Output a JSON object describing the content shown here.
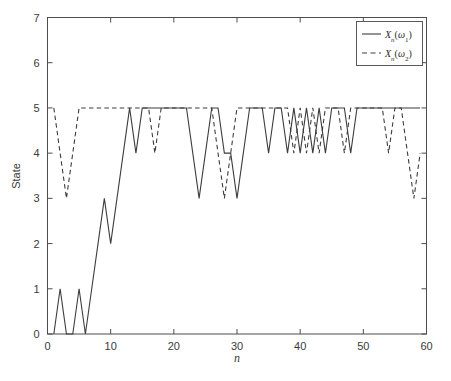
{
  "chart_data": {
    "type": "line",
    "title": "",
    "xlabel": "n",
    "ylabel": "State",
    "xlim": [
      0,
      60
    ],
    "ylim": [
      0,
      7
    ],
    "xticks": [
      0,
      10,
      20,
      30,
      40,
      50,
      60
    ],
    "yticks": [
      0,
      1,
      2,
      3,
      4,
      5,
      6,
      7
    ],
    "xtick_labels": [
      "0",
      "10",
      "20",
      "30",
      "40",
      "50",
      "60"
    ],
    "ytick_labels": [
      "0",
      "1",
      "2",
      "3",
      "4",
      "5",
      "6",
      "7"
    ],
    "grid": false,
    "legend_position": "top-right",
    "line_color": "#3d3d3d",
    "axis_color": "#4d4d4d",
    "background": "#ffffff",
    "series": [
      {
        "name": "X_n(omega_1)",
        "label": "Xn(ω1)",
        "label_base": "X",
        "label_sub": "n",
        "label_arg_open": "(",
        "label_omega": "ω",
        "label_omega_sub": "1",
        "label_arg_close": ")",
        "style": "solid",
        "x": [
          1,
          2,
          3,
          4,
          5,
          6,
          7,
          8,
          9,
          10,
          11,
          12,
          13,
          14,
          15,
          16,
          17,
          18,
          19,
          20,
          21,
          22,
          23,
          24,
          25,
          26,
          27,
          28,
          29,
          30,
          31,
          32,
          33,
          34,
          35,
          36,
          37,
          38,
          39,
          40,
          41,
          42,
          43,
          44,
          45,
          46,
          47,
          48,
          49,
          50,
          51,
          52,
          53,
          54,
          55,
          56,
          57,
          58,
          59
        ],
        "values": [
          0,
          1,
          0,
          0,
          1,
          0,
          1,
          2,
          3,
          2,
          3,
          4,
          5,
          4,
          5,
          5,
          5,
          5,
          5,
          5,
          5,
          5,
          4,
          3,
          4,
          5,
          5,
          4,
          4,
          3,
          4,
          5,
          5,
          5,
          4,
          5,
          5,
          4,
          5,
          4,
          5,
          4,
          5,
          4,
          5,
          5,
          5,
          4,
          5,
          5,
          5,
          5,
          5,
          5,
          5,
          5,
          5,
          5,
          5
        ]
      },
      {
        "name": "X_n(omega_2)",
        "label": "Xn(ω2)",
        "label_base": "X",
        "label_sub": "n",
        "label_arg_open": "(",
        "label_omega": "ω",
        "label_omega_sub": "2",
        "label_arg_close": ")",
        "style": "dashed",
        "x": [
          1,
          2,
          3,
          4,
          5,
          6,
          7,
          8,
          9,
          10,
          11,
          12,
          13,
          14,
          15,
          16,
          17,
          18,
          19,
          20,
          21,
          22,
          23,
          24,
          25,
          26,
          27,
          28,
          29,
          30,
          31,
          32,
          33,
          34,
          35,
          36,
          37,
          38,
          39,
          40,
          41,
          42,
          43,
          44,
          45,
          46,
          47,
          48,
          49,
          50,
          51,
          52,
          53,
          54,
          55,
          56,
          57,
          58,
          59
        ],
        "values": [
          5,
          4,
          3,
          4,
          5,
          5,
          5,
          5,
          5,
          5,
          5,
          5,
          5,
          5,
          5,
          5,
          4,
          5,
          5,
          5,
          5,
          5,
          5,
          5,
          5,
          5,
          4,
          3,
          4,
          5,
          5,
          5,
          5,
          5,
          5,
          5,
          5,
          5,
          4,
          5,
          4,
          5,
          4,
          5,
          5,
          5,
          4,
          5,
          5,
          5,
          5,
          5,
          5,
          4,
          5,
          5,
          4,
          3,
          4
        ]
      }
    ]
  },
  "legend": {
    "entries": [
      {
        "style": "solid",
        "label": "Xn(ω1)"
      },
      {
        "style": "dashed",
        "label": "Xn(ω2)"
      }
    ]
  }
}
